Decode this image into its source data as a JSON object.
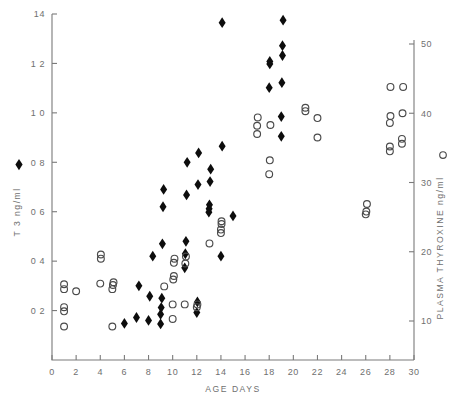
{
  "chart_data": {
    "type": "scatter",
    "title": "",
    "xlabel": "AGE  DAYS",
    "xlim": [
      0,
      30
    ],
    "xticks": [
      0,
      2,
      4,
      6,
      8,
      10,
      12,
      14,
      16,
      18,
      20,
      22,
      24,
      26,
      28,
      30
    ],
    "xticklabels": [
      "0",
      "2",
      "4",
      "6",
      "8",
      "10",
      "12",
      "14",
      "16",
      "18",
      "20",
      "22",
      "24",
      "26",
      "28",
      "30"
    ],
    "grid": false,
    "legend_position": "axis-labels",
    "axes": [
      {
        "id": "left",
        "label": "T 3  ng/ml",
        "label_marker": "♦",
        "unit": "ng/ml",
        "ylim": [
          0.0,
          1.4
        ],
        "yticks": [
          0.2,
          0.4,
          0.6,
          0.8,
          1.0,
          1.2,
          1.4
        ],
        "yticklabels": [
          "0 2",
          "0 4",
          "0 6",
          "0 8",
          "1 0",
          "1 2",
          "14"
        ]
      },
      {
        "id": "right",
        "label": "PLASMA  THYROXINE  ng/ml",
        "label_marker": "○",
        "unit": "ng/ml",
        "ylim": [
          0,
          50
        ],
        "yticks": [
          10,
          20,
          30,
          40,
          50
        ],
        "yticklabels": [
          "10",
          "20",
          "30",
          "40",
          "50"
        ]
      }
    ],
    "series": [
      {
        "name": "T 3",
        "marker": "filled-diamond",
        "color": "#0d0d0d",
        "axis": "left",
        "xlabel": "AGE  DAYS",
        "ylabel": "T 3  ng/ml",
        "points": [
          [
            6.0,
            0.148
          ],
          [
            7.0,
            0.172
          ],
          [
            7.2,
            0.3
          ],
          [
            8.0,
            0.16
          ],
          [
            8.1,
            0.258
          ],
          [
            8.35,
            0.42
          ],
          [
            9.0,
            0.146
          ],
          [
            9.0,
            0.185
          ],
          [
            9.05,
            0.212
          ],
          [
            9.1,
            0.25
          ],
          [
            9.15,
            0.47
          ],
          [
            9.2,
            0.62
          ],
          [
            9.25,
            0.69
          ],
          [
            11.0,
            0.373
          ],
          [
            11.05,
            0.43
          ],
          [
            11.1,
            0.48
          ],
          [
            11.15,
            0.668
          ],
          [
            11.2,
            0.8
          ],
          [
            12.0,
            0.192
          ],
          [
            12.05,
            0.235
          ],
          [
            12.1,
            0.71
          ],
          [
            12.15,
            0.838
          ],
          [
            13.0,
            0.598
          ],
          [
            13.02,
            0.612
          ],
          [
            13.05,
            0.628
          ],
          [
            13.1,
            0.722
          ],
          [
            13.15,
            0.772
          ],
          [
            14.0,
            0.42
          ],
          [
            14.1,
            0.865
          ],
          [
            14.1,
            1.365
          ],
          [
            15.0,
            0.583
          ],
          [
            18.0,
            1.102
          ],
          [
            18.05,
            1.198
          ],
          [
            18.05,
            1.208
          ],
          [
            19.0,
            0.905
          ],
          [
            19.0,
            0.985
          ],
          [
            19.05,
            1.122
          ],
          [
            19.1,
            1.232
          ],
          [
            19.1,
            1.272
          ],
          [
            19.15,
            1.375
          ]
        ]
      },
      {
        "name": "PLASMA THYROXINE",
        "marker": "open-circle",
        "color": "#4a4a4a",
        "axis": "right",
        "xlabel": "AGE  DAYS",
        "ylabel": "PLASMA  THYROXINE  ng/ml",
        "points": [
          [
            1.0,
            9.2
          ],
          [
            1.0,
            11.4
          ],
          [
            1.0,
            12.0
          ],
          [
            1.0,
            14.6
          ],
          [
            1.0,
            15.3
          ],
          [
            2.0,
            14.3
          ],
          [
            4.0,
            15.4
          ],
          [
            4.05,
            19.0
          ],
          [
            4.05,
            19.6
          ],
          [
            5.0,
            9.2
          ],
          [
            5.0,
            14.6
          ],
          [
            5.05,
            15.2
          ],
          [
            5.1,
            15.6
          ],
          [
            9.3,
            15.0
          ],
          [
            10.0,
            12.4
          ],
          [
            10.0,
            10.3
          ],
          [
            10.05,
            16.0
          ],
          [
            10.1,
            16.5
          ],
          [
            10.1,
            18.4
          ],
          [
            10.15,
            19.0
          ],
          [
            11.0,
            12.4
          ],
          [
            11.05,
            18.3
          ],
          [
            11.1,
            19.3
          ],
          [
            12.0,
            12.0
          ],
          [
            12.05,
            12.4
          ],
          [
            13.05,
            21.2
          ],
          [
            14.0,
            22.7
          ],
          [
            14.0,
            23.2
          ],
          [
            14.05,
            24.0
          ],
          [
            14.05,
            24.4
          ],
          [
            17.0,
            37.0
          ],
          [
            17.0,
            38.2
          ],
          [
            17.05,
            39.4
          ],
          [
            18.0,
            31.2
          ],
          [
            18.05,
            33.2
          ],
          [
            18.1,
            38.3
          ],
          [
            21.0,
            40.3
          ],
          [
            21.0,
            40.8
          ],
          [
            22.0,
            36.5
          ],
          [
            22.0,
            39.3
          ],
          [
            26.0,
            25.4
          ],
          [
            26.05,
            25.8
          ],
          [
            26.1,
            26.9
          ],
          [
            28.0,
            34.5
          ],
          [
            28.0,
            35.2
          ],
          [
            28.0,
            38.6
          ],
          [
            28.05,
            39.6
          ],
          [
            28.05,
            43.8
          ],
          [
            29.0,
            35.6
          ],
          [
            29.0,
            36.3
          ],
          [
            29.05,
            40.0
          ],
          [
            29.1,
            43.8
          ]
        ]
      }
    ]
  }
}
